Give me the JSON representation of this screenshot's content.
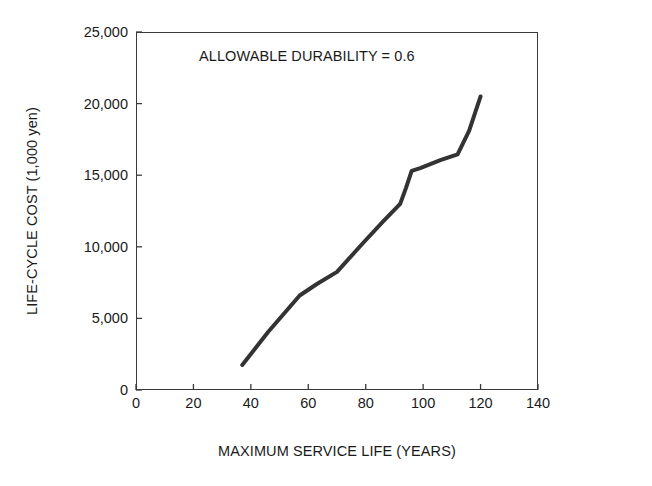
{
  "chart_data": {
    "type": "line",
    "title": "",
    "annotations": [
      {
        "text": "ALLOWABLE DURABILITY = 0.6",
        "x": 60,
        "y": 23500
      }
    ],
    "xlabel": "MAXIMUM SERVICE LIFE (YEARS)",
    "ylabel": "LIFE-CYCLE COST (1,000 yen)",
    "xlim": [
      0,
      140
    ],
    "ylim": [
      0,
      25000
    ],
    "xticks": [
      0,
      20,
      40,
      60,
      80,
      100,
      120,
      140
    ],
    "xtick_labels": [
      "0",
      "20",
      "40",
      "60",
      "80",
      "100",
      "120",
      "140"
    ],
    "yticks": [
      0,
      5000,
      10000,
      15000,
      20000,
      25000
    ],
    "ytick_labels": [
      "0",
      "5,000",
      "10,000",
      "15,000",
      "20,000",
      "25,000"
    ],
    "grid": false,
    "legend": null,
    "series": [
      {
        "name": "Life-cycle cost",
        "color": "#333333",
        "linewidth": 4,
        "x": [
          37,
          46,
          57,
          63,
          70,
          79,
          86,
          92,
          94,
          96,
          99,
          106,
          112,
          116,
          120
        ],
        "y": [
          1750,
          4050,
          6600,
          7400,
          8250,
          10250,
          11750,
          13000,
          14100,
          15300,
          15500,
          16050,
          16450,
          18100,
          20500
        ]
      }
    ]
  },
  "axis": {
    "x": {
      "title": "MAXIMUM SERVICE LIFE (YEARS)",
      "ticks": [
        "0",
        "20",
        "40",
        "60",
        "80",
        "100",
        "120",
        "140"
      ]
    },
    "y": {
      "title": "LIFE-CYCLE COST (1,000 yen)",
      "ticks": [
        "0",
        "5,000",
        "10,000",
        "15,000",
        "20,000",
        "25,000"
      ]
    }
  },
  "annotation_text": "ALLOWABLE DURABILITY = 0.6",
  "colors": {
    "line": "#333333",
    "frame": "#3a3a3a",
    "text": "#1a1a1a",
    "background": "#ffffff"
  }
}
